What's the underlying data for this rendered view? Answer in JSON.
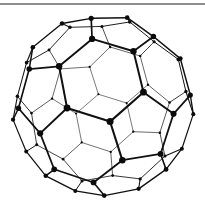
{
  "figure": {
    "name": "truncated-icosahedron-graph",
    "background_color": "#ffffff",
    "edge_color": "#101010",
    "vertex_color": "#0b0b0b",
    "rule_color": "#8d8d8d"
  },
  "chart_data": {
    "type": "scatter",
    "xlabel": "",
    "ylabel": "",
    "grid": false,
    "legend": null,
    "vertex_count": 60,
    "edge_count": 90,
    "face_count": 32,
    "pentagon_faces": 12,
    "hexagon_faces": 20,
    "vertex_degree": 3,
    "projection": {
      "type": "perspective",
      "center_x": 103,
      "center_y": 99,
      "radius": 89,
      "camera_distance": 4.6,
      "rotate_x_deg": -16,
      "rotate_y_deg": 22,
      "rotate_z_deg": 6,
      "min_vertex_radius": 1.1,
      "max_vertex_radius": 3.5,
      "min_edge_width": 0.55,
      "max_edge_width": 2.1
    },
    "solid_vertices_3d": [
      [
        0,
        1,
        3
      ],
      [
        0,
        3,
        1
      ],
      [
        0,
        -1,
        3
      ],
      [
        0,
        -3,
        1
      ],
      [
        0,
        1,
        -3
      ],
      [
        0,
        3,
        -1
      ],
      [
        0,
        -1,
        -3
      ],
      [
        0,
        -3,
        -1
      ],
      [
        1,
        3,
        0
      ],
      [
        3,
        1,
        0
      ],
      [
        -1,
        3,
        0
      ],
      [
        -3,
        1,
        0
      ],
      [
        1,
        -3,
        0
      ],
      [
        3,
        -1,
        0
      ],
      [
        -1,
        -3,
        0
      ],
      [
        -3,
        -1,
        0
      ],
      [
        3,
        0,
        1
      ],
      [
        1,
        0,
        3
      ],
      [
        3,
        0,
        -1
      ],
      [
        1,
        0,
        -3
      ],
      [
        -3,
        0,
        1
      ],
      [
        -1,
        0,
        3
      ],
      [
        -3,
        0,
        -1
      ],
      [
        -1,
        0,
        -3
      ],
      [
        2,
        1,
        2
      ],
      [
        2,
        2,
        1
      ],
      [
        1,
        2,
        2
      ],
      [
        2,
        1,
        -2
      ],
      [
        2,
        2,
        -1
      ],
      [
        1,
        2,
        -2
      ],
      [
        2,
        -1,
        2
      ],
      [
        2,
        -2,
        1
      ],
      [
        1,
        -2,
        2
      ],
      [
        2,
        -1,
        -2
      ],
      [
        2,
        -2,
        -1
      ],
      [
        1,
        -2,
        -2
      ],
      [
        -2,
        1,
        2
      ],
      [
        -2,
        2,
        1
      ],
      [
        -1,
        2,
        2
      ],
      [
        -2,
        1,
        -2
      ],
      [
        -2,
        2,
        -1
      ],
      [
        -1,
        2,
        -2
      ],
      [
        -2,
        -1,
        2
      ],
      [
        -2,
        -2,
        1
      ],
      [
        -1,
        -2,
        2
      ],
      [
        -2,
        -1,
        -2
      ],
      [
        -2,
        -2,
        -1
      ],
      [
        -1,
        -2,
        -2
      ]
    ],
    "note": "Vertex positions are generated by the template from the canonical truncated-icosahedron construction (all permutations of (0,1,3), (1,2,2) and cyclic variants scaled to the sphere), then rotated and perspective-projected with the parameters above."
  }
}
